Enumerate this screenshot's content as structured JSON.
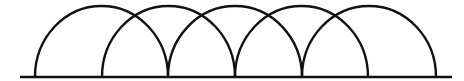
{
  "diagram": {
    "stroke_color": "#111111",
    "background": "#ffffff",
    "baseline": {
      "x1": 20,
      "x2": 452,
      "y": 77
    },
    "arcs": [
      {
        "x_start": 35,
        "x_end": 168
      },
      {
        "x_start": 102,
        "x_end": 235
      },
      {
        "x_start": 168,
        "x_end": 302
      },
      {
        "x_start": 235,
        "x_end": 368
      },
      {
        "x_start": 302,
        "x_end": 436
      }
    ],
    "arc_top_y": 6
  }
}
